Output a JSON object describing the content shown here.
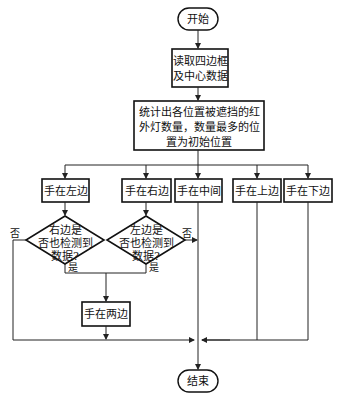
{
  "diagram": {
    "type": "flowchart",
    "nodes": {
      "start": {
        "label": "开始"
      },
      "read": {
        "lines": [
          "读取四边框",
          "及中心数据"
        ]
      },
      "count": {
        "lines": [
          "统计出各位置被遮挡的红",
          "外灯数量，数量最多的位",
          "置为初始位置"
        ]
      },
      "hand_left": {
        "label": "手在左边"
      },
      "hand_right": {
        "label": "手在右边"
      },
      "hand_center": {
        "label": "手在中间"
      },
      "hand_top": {
        "label": "手在上边"
      },
      "hand_bottom": {
        "label": "手在下边"
      },
      "decision_right": {
        "lines": [
          "右边是",
          "否也检测到",
          "数据?"
        ]
      },
      "decision_left": {
        "lines": [
          "左边是",
          "否也检测到",
          "数据?"
        ]
      },
      "hand_both": {
        "label": "手在两边"
      },
      "end": {
        "label": "结束"
      }
    },
    "edge_labels": {
      "no_left": "否",
      "no_right": "否",
      "yes_left": "是",
      "yes_right": "是"
    }
  }
}
